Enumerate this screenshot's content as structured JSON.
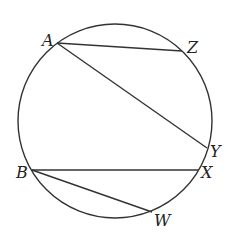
{
  "diagram": {
    "type": "circle-chords",
    "circle": {
      "cx": 115,
      "cy": 121,
      "r": 97
    },
    "colors": {
      "line": "#333333",
      "label": "#222222",
      "background": "#ffffff"
    },
    "points": {
      "A": {
        "label": "A",
        "x": 57,
        "y": 43
      },
      "Z": {
        "label": "Z",
        "x": 182,
        "y": 51
      },
      "Y": {
        "label": "Y",
        "x": 207,
        "y": 148
      },
      "X": {
        "label": "X",
        "x": 198,
        "y": 170
      },
      "B": {
        "label": "B",
        "x": 32,
        "y": 170
      },
      "W": {
        "label": "W",
        "x": 152,
        "y": 212
      }
    },
    "chords": [
      {
        "from": "A",
        "to": "Z"
      },
      {
        "from": "A",
        "to": "Y"
      },
      {
        "from": "B",
        "to": "X"
      },
      {
        "from": "B",
        "to": "W"
      }
    ]
  }
}
